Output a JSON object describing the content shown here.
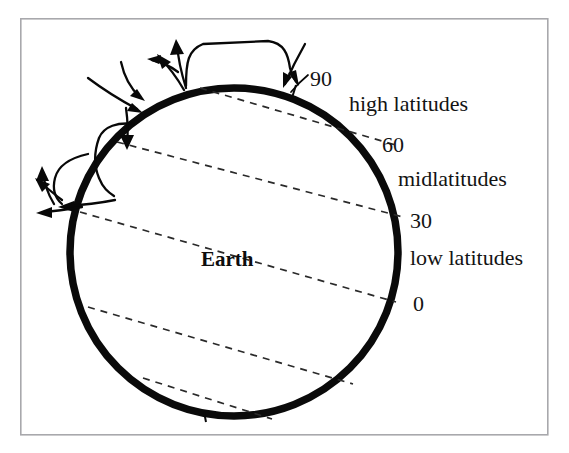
{
  "figure": {
    "background_color": "#ffffff",
    "frame": {
      "name": "figure-border",
      "color": "#a8a8ac",
      "x": 20,
      "y": 18,
      "width": 528,
      "height": 417
    },
    "earth": {
      "label": "Earth",
      "outline_color": "#0a0a0a",
      "fill_color": "#ffffff",
      "center_x": 234,
      "center_y": 252,
      "radius": 164,
      "label_x": 201,
      "label_y": 265
    },
    "latitude_labels": [
      {
        "id": "lat-90",
        "text": "90",
        "x": 310,
        "y": 86
      },
      {
        "id": "lat-60",
        "text": "60",
        "x": 382,
        "y": 152
      },
      {
        "id": "lat-30",
        "text": "30",
        "x": 410,
        "y": 228
      },
      {
        "id": "lat-0",
        "text": "0",
        "x": 413,
        "y": 311
      }
    ],
    "zone_labels": [
      {
        "id": "zone-high",
        "text": "high latitudes",
        "x": 349,
        "y": 111
      },
      {
        "id": "zone-mid",
        "text": "midlatitudes",
        "x": 398,
        "y": 186
      },
      {
        "id": "zone-low",
        "text": "low latitudes",
        "x": 410,
        "y": 265
      }
    ],
    "latitude_lines": [
      {
        "id": "latline-90",
        "degrees": 90,
        "x1": 200,
        "y1": 88,
        "x2": 399,
        "y2": 146
      },
      {
        "id": "latline-60",
        "degrees": 60,
        "x1": 117,
        "y1": 142,
        "x2": 402,
        "y2": 216
      },
      {
        "id": "latline-30",
        "degrees": 30,
        "x1": 81,
        "y1": 212,
        "x2": 395,
        "y2": 301
      },
      {
        "id": "latline-0",
        "degrees": 0,
        "x1": 88,
        "y1": 307,
        "x2": 352,
        "y2": 383
      },
      {
        "id": "latline-south",
        "degrees": -30,
        "x1": 143,
        "y1": 378,
        "x2": 270,
        "y2": 418
      }
    ],
    "circulation_cells": [
      {
        "id": "polar-cell",
        "position": "top"
      },
      {
        "id": "ferrel-cell",
        "position": "upper-left"
      },
      {
        "id": "hadley-cell",
        "position": "left"
      }
    ],
    "colors": {
      "ink": "#0a0a0a",
      "dashed_line": "#2a2a2a",
      "frame": "#a8a8ac",
      "paper": "#ffffff"
    }
  }
}
